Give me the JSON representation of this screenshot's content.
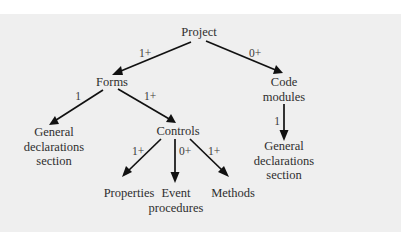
{
  "diagram": {
    "type": "hierarchy",
    "colors": {
      "panel_background": "#efefef",
      "page_background": "#ffffff",
      "text": "#2e2e2e",
      "arrows": "#111111"
    },
    "nodes": {
      "project": {
        "lines": [
          "Project"
        ]
      },
      "forms": {
        "lines": [
          "Forms"
        ]
      },
      "code_modules": {
        "lines": [
          "Code",
          "modules"
        ]
      },
      "forms_general_declarations": {
        "lines": [
          "General",
          "declarations",
          "section"
        ]
      },
      "controls": {
        "lines": [
          "Controls"
        ]
      },
      "module_general_declarations": {
        "lines": [
          "General",
          "declarations",
          "section"
        ]
      },
      "properties": {
        "lines": [
          "Properties"
        ]
      },
      "event_procedures": {
        "lines": [
          "Event",
          "procedures"
        ]
      },
      "methods": {
        "lines": [
          "Methods"
        ]
      }
    },
    "edges": [
      {
        "from": "Project",
        "to": "Forms",
        "label": "1+"
      },
      {
        "from": "Project",
        "to": "Code modules",
        "label": "0+"
      },
      {
        "from": "Forms",
        "to": "General declarations section",
        "label": "1"
      },
      {
        "from": "Forms",
        "to": "Controls",
        "label": "1+"
      },
      {
        "from": "Code modules",
        "to": "General declarations section",
        "label": "1"
      },
      {
        "from": "Controls",
        "to": "Properties",
        "label": "1+"
      },
      {
        "from": "Controls",
        "to": "Event procedures",
        "label": "0+"
      },
      {
        "from": "Controls",
        "to": "Methods",
        "label": "1+"
      }
    ]
  }
}
